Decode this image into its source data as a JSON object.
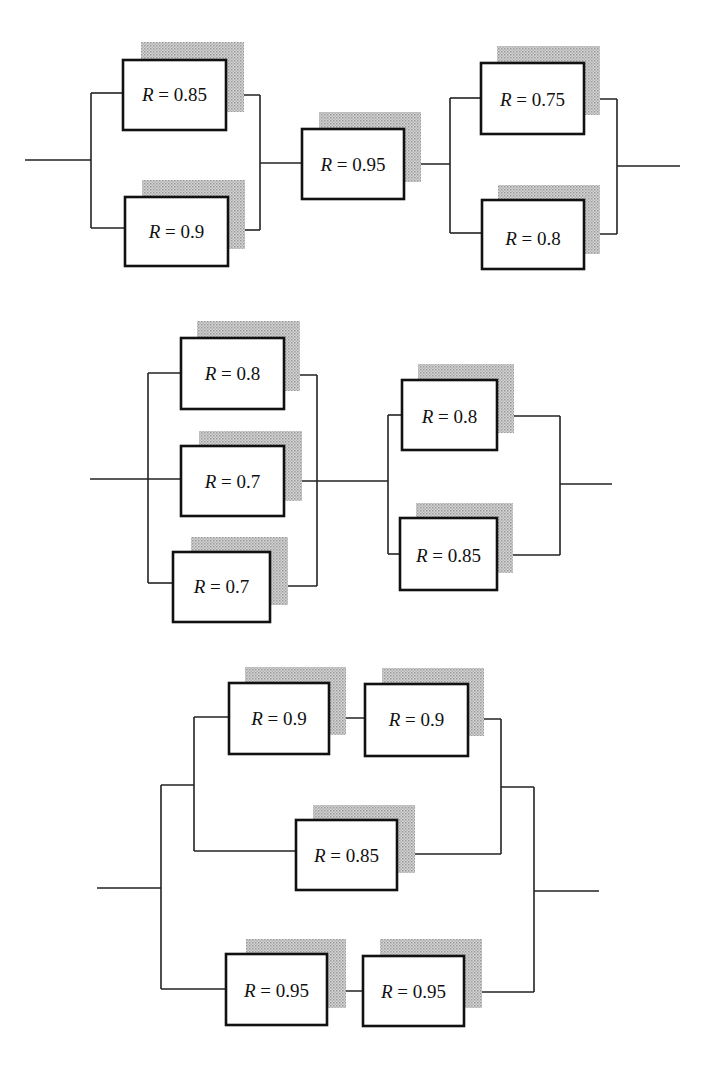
{
  "figure": {
    "label_prefix": "R",
    "label_equals": " = "
  },
  "diagrams": [
    {
      "name": "diagram-1",
      "structure": "parallel(0.85, 0.9) -> 0.95 -> parallel(0.75, 0.8)",
      "components": [
        {
          "id": "c1",
          "value": "0.85"
        },
        {
          "id": "c2",
          "value": "0.9"
        },
        {
          "id": "c3",
          "value": "0.95"
        },
        {
          "id": "c4",
          "value": "0.75"
        },
        {
          "id": "c5",
          "value": "0.8"
        }
      ]
    },
    {
      "name": "diagram-2",
      "structure": "parallel(0.8, 0.7, 0.7) -> parallel(0.8, 0.85)",
      "components": [
        {
          "id": "c1",
          "value": "0.8"
        },
        {
          "id": "c2",
          "value": "0.7"
        },
        {
          "id": "c3",
          "value": "0.7"
        },
        {
          "id": "c4",
          "value": "0.8"
        },
        {
          "id": "c5",
          "value": "0.85"
        }
      ]
    },
    {
      "name": "diagram-3",
      "structure": "parallel( parallel( series(0.9, 0.9), 0.85 ), series(0.95, 0.95) )",
      "components": [
        {
          "id": "c1",
          "value": "0.9"
        },
        {
          "id": "c2",
          "value": "0.9"
        },
        {
          "id": "c3",
          "value": "0.85"
        },
        {
          "id": "c4",
          "value": "0.95"
        },
        {
          "id": "c5",
          "value": "0.95"
        }
      ]
    }
  ]
}
